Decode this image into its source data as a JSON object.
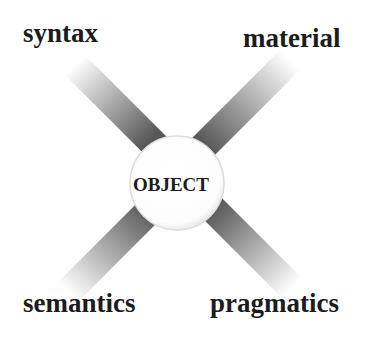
{
  "diagram": {
    "center": {
      "label": "OBJECT"
    },
    "corners": {
      "top_left": {
        "label": "syntax"
      },
      "top_right": {
        "label": "material"
      },
      "bottom_left": {
        "label": "semantics"
      },
      "bottom_right": {
        "label": "pragmatics"
      }
    },
    "colors": {
      "background": "#ffffff",
      "text": "#1c1c1c",
      "bar_dark": "#555555",
      "bar_light": "#ffffff",
      "circle_fill": "#ffffff",
      "circle_edge": "#d0d0d0"
    }
  }
}
